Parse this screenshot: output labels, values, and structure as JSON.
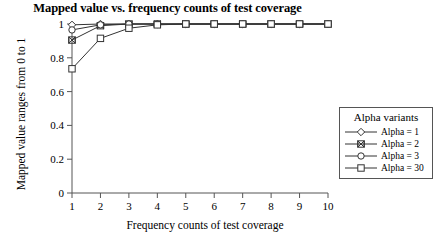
{
  "chart_data": {
    "type": "line",
    "title": "Mapped value vs. frequency counts of test coverage",
    "xlabel": "Frequency counts of test coverage",
    "ylabel": "Mapped value ranges from 0 to 1",
    "x": [
      1,
      2,
      3,
      4,
      5,
      6,
      7,
      8,
      9,
      10
    ],
    "xlim": [
      1,
      10
    ],
    "ylim": [
      0,
      1
    ],
    "xticks": [
      "1",
      "2",
      "3",
      "4",
      "5",
      "6",
      "7",
      "8",
      "9",
      "10"
    ],
    "yticks": [
      "0",
      "0.2",
      "0.4",
      "0.6",
      "0.8",
      "1"
    ],
    "ytick_values": [
      0,
      0.2,
      0.4,
      0.6,
      0.8,
      1
    ],
    "grid": false,
    "legend_position": "right-outside",
    "legend_title": "Alpha variants",
    "series": [
      {
        "name": "Alpha = 1",
        "marker": "diamond",
        "color": "#333333",
        "values": [
          0.995,
          1.0,
          1.0,
          1.0,
          1.0,
          1.0,
          1.0,
          1.0,
          1.0,
          1.0
        ]
      },
      {
        "name": "Alpha = 2",
        "marker": "bowtie",
        "color": "#333333",
        "values": [
          0.905,
          0.99,
          1.0,
          1.0,
          1.0,
          1.0,
          1.0,
          1.0,
          1.0,
          1.0
        ]
      },
      {
        "name": "Alpha = 3",
        "marker": "circle",
        "color": "#333333",
        "values": [
          0.965,
          0.995,
          1.0,
          1.0,
          1.0,
          1.0,
          1.0,
          1.0,
          1.0,
          1.0
        ]
      },
      {
        "name": "Alpha = 30",
        "marker": "square",
        "color": "#333333",
        "values": [
          0.735,
          0.915,
          0.975,
          0.995,
          1.0,
          1.0,
          1.0,
          1.0,
          1.0,
          1.0
        ]
      }
    ]
  },
  "axis": {
    "line_color": "#555555"
  }
}
